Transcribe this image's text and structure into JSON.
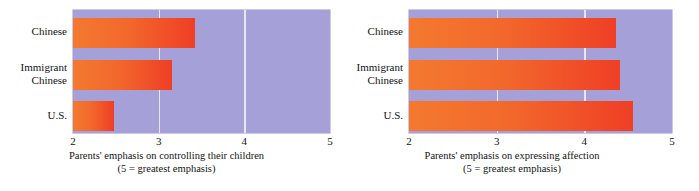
{
  "chart_data": [
    {
      "type": "bar",
      "orientation": "horizontal",
      "title": "",
      "xlabel": "Parents' emphasis on controlling their children",
      "xlabel_note": "(5 = greatest emphasis)",
      "ylabel": "",
      "categories": [
        "Chinese",
        "Immigrant Chinese",
        "U.S."
      ],
      "category_lines": [
        [
          "Chinese"
        ],
        [
          "Immigrant",
          "Chinese"
        ],
        [
          "U.S."
        ]
      ],
      "values": [
        3.42,
        3.16,
        2.48
      ],
      "xlim": [
        2,
        5
      ],
      "xticks": [
        2,
        3,
        4,
        5
      ],
      "xtick_labels": [
        "2",
        "3",
        "4",
        "5"
      ],
      "grid": true,
      "gridlines_at": [
        3,
        4
      ],
      "legend": "none",
      "plot_background": "#a5a0d8",
      "bar_color_start": "#f4792f",
      "bar_color_end": "#ef3f25",
      "gridline_color": "#e8e6f6"
    },
    {
      "type": "bar",
      "orientation": "horizontal",
      "title": "",
      "xlabel": "Parents' emphasis on expressing affection",
      "xlabel_note": "(5 = greatest emphasis)",
      "ylabel": "",
      "categories": [
        "Chinese",
        "Immigrant Chinese",
        "U.S."
      ],
      "category_lines": [
        [
          "Chinese"
        ],
        [
          "Immigrant",
          "Chinese"
        ],
        [
          "U.S."
        ]
      ],
      "values": [
        4.36,
        4.41,
        4.56
      ],
      "xlim": [
        2,
        5
      ],
      "xticks": [
        2,
        3,
        4,
        5
      ],
      "xtick_labels": [
        "2",
        "3",
        "4",
        "5"
      ],
      "grid": true,
      "gridlines_at": [
        3,
        4
      ],
      "legend": "none",
      "plot_background": "#a5a0d8",
      "bar_color_start": "#f4792f",
      "bar_color_end": "#ef3f25",
      "gridline_color": "#e8e6f6"
    }
  ]
}
